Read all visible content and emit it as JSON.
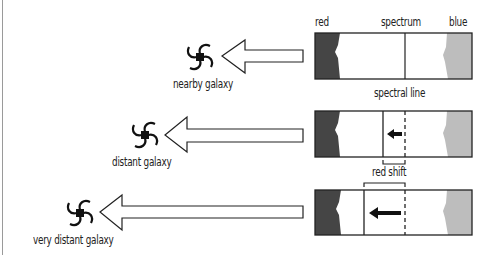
{
  "diagram": {
    "header_labels": {
      "red": "red",
      "spectrum": "spectrum",
      "blue": "blue"
    },
    "annotations": {
      "spectral_line": "spectral line",
      "red_shift": "red shift"
    },
    "rows": [
      {
        "galaxy_label": "nearby galaxy",
        "shift": "none"
      },
      {
        "galaxy_label": "distant galaxy",
        "shift": "small"
      },
      {
        "galaxy_label": "very distant galaxy",
        "shift": "large"
      }
    ],
    "colors": {
      "red_band": "#454545",
      "blue_band": "#bdbdbd",
      "line": "#222222",
      "background": "#ffffff"
    }
  }
}
